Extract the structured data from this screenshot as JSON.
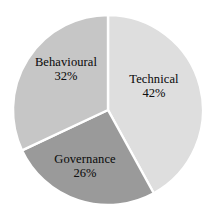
{
  "chart_data": {
    "type": "pie",
    "title": "",
    "subtitle": "",
    "xlabel": "",
    "ylabel": "",
    "legend_position": "none",
    "grid": false,
    "labels_inside_slices": true,
    "start_angle_deg": 0,
    "direction": "clockwise",
    "categories": [
      "Technical",
      "Governance",
      "Behavioural"
    ],
    "values": [
      42,
      26,
      32
    ],
    "value_suffix": "%",
    "total": 100,
    "slices": [
      {
        "label": "Technical",
        "value": 42,
        "value_text": "42%",
        "color": "#dedede",
        "start_angle_deg": 0,
        "end_angle_deg": 151.2
      },
      {
        "label": "Governance",
        "value": 26,
        "value_text": "26%",
        "color": "#9a9a9a",
        "start_angle_deg": 151.2,
        "end_angle_deg": 244.8
      },
      {
        "label": "Behavioural",
        "value": 32,
        "value_text": "32%",
        "color": "#c6c6c6",
        "start_angle_deg": 244.8,
        "end_angle_deg": 360
      }
    ]
  },
  "colors": {
    "background": "#ffffff",
    "slice_border": "#ffffff",
    "label_text": "#111111",
    "technical": "#dedede",
    "governance": "#9a9a9a",
    "behavioural": "#c6c6c6"
  },
  "geometry": {
    "center_x": 108,
    "center_y": 110,
    "radius": 95
  }
}
